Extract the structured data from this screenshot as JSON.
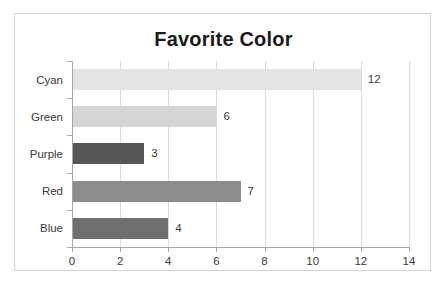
{
  "chart_data": {
    "type": "bar",
    "orientation": "horizontal",
    "title": "Favorite Color",
    "xlabel": "",
    "ylabel": "",
    "categories": [
      "Cyan",
      "Green",
      "Purple",
      "Red",
      "Blue"
    ],
    "values": [
      12,
      6,
      3,
      7,
      4
    ],
    "data_labels": [
      "12",
      "6",
      "3",
      "7",
      "4"
    ],
    "bar_colors": [
      "#e4e4e4",
      "#d5d5d5",
      "#555555",
      "#8c8c8c",
      "#6f6f6f"
    ],
    "xlim": [
      0,
      14
    ],
    "xticks": [
      0,
      2,
      4,
      6,
      8,
      10,
      12,
      14
    ],
    "xtick_labels": [
      "0",
      "2",
      "4",
      "6",
      "8",
      "10",
      "12",
      "14"
    ],
    "grid": "vertical",
    "legend": "none",
    "axis_color": "#a6a6a6",
    "gridline_color": "#d9d9d9",
    "title_color": "#1a1a1a",
    "border_color": "#d4d4d4",
    "background": "#ffffff"
  }
}
